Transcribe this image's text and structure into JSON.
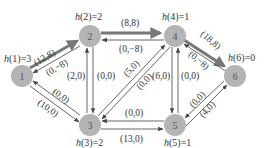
{
  "diagram": {
    "type": "flow-network-with-potentials",
    "nodes": [
      {
        "id": "1",
        "label": "1",
        "h_label": "h(1)=3",
        "x": 22,
        "y": 76
      },
      {
        "id": "2",
        "label": "2",
        "h_label": "h(2)=2",
        "x": 90,
        "y": 36
      },
      {
        "id": "3",
        "label": "3",
        "h_label": "h(3)=2",
        "x": 90,
        "y": 125
      },
      {
        "id": "4",
        "label": "4",
        "h_label": "h(4)=1",
        "x": 175,
        "y": 36
      },
      {
        "id": "5",
        "label": "5",
        "h_label": "h(5)=1",
        "x": 175,
        "y": 125
      },
      {
        "id": "6",
        "label": "6",
        "h_label": "h(6)=0",
        "x": 235,
        "y": 76
      }
    ],
    "edges": [
      {
        "from": "1",
        "to": "2",
        "label": "(12,8)",
        "style": "thick"
      },
      {
        "from": "2",
        "to": "1",
        "label": "(0,-8)",
        "style": "thin"
      },
      {
        "from": "1",
        "to": "3",
        "label": "(10,0)",
        "style": "thin"
      },
      {
        "from": "3",
        "to": "1",
        "label": "(0,0)",
        "style": "thin"
      },
      {
        "from": "2",
        "to": "4",
        "label": "(8,8)",
        "style": "thick"
      },
      {
        "from": "4",
        "to": "2",
        "label": "(0,-8)",
        "style": "thin"
      },
      {
        "from": "2",
        "to": "3",
        "label": "(2,0)",
        "style": "thin"
      },
      {
        "from": "3",
        "to": "2",
        "label": "(0,0)",
        "style": "thin"
      },
      {
        "from": "3",
        "to": "4",
        "label": "(5,0)",
        "style": "thin"
      },
      {
        "from": "4",
        "to": "3",
        "label": "(0,0)",
        "style": "thin"
      },
      {
        "from": "4",
        "to": "5",
        "label": "(6,0)",
        "style": "thin"
      },
      {
        "from": "5",
        "to": "4",
        "label": "(0,0)",
        "style": "thin"
      },
      {
        "from": "3",
        "to": "5",
        "label": "(13,0)",
        "style": "thin"
      },
      {
        "from": "5",
        "to": "3",
        "label": "(0,0)",
        "style": "thin"
      },
      {
        "from": "4",
        "to": "6",
        "label": "(18,8)",
        "style": "thick"
      },
      {
        "from": "6",
        "to": "4",
        "label": "(0,-8)",
        "style": "thin"
      },
      {
        "from": "5",
        "to": "6",
        "label": "(4,0)",
        "style": "thin"
      },
      {
        "from": "6",
        "to": "5",
        "label": "(0,0)",
        "style": "thin"
      }
    ]
  },
  "labels": {
    "n1": "1",
    "n2": "2",
    "n3": "3",
    "n4": "4",
    "n5": "5",
    "n6": "6",
    "h1_fn": "h",
    "h1_rest": "(1)=3",
    "h2_fn": "h",
    "h2_rest": "(2)=2",
    "h3_fn": "h",
    "h3_rest": "(3)=2",
    "h4_fn": "h",
    "h4_rest": "(4)=1",
    "h5_fn": "h",
    "h5_rest": "(5)=1",
    "h6_fn": "h",
    "h6_rest": "(6)=0",
    "e12": "(12,8)",
    "e21": "(0,−8)",
    "e13": "(10,0)",
    "e31": "(0,0)",
    "e24": "(8,8)",
    "e42": "(0,−8)",
    "e23": "(2,0)",
    "e32": "(0,0)",
    "e34": "(5,0)",
    "e43": "(0,0)",
    "e45": "(6,0)",
    "e54": "(0,0)",
    "e35": "(13,0)",
    "e53": "(0,0)",
    "e46": "(18,8)",
    "e64": "(0,−8)",
    "e56": "(4,0)",
    "e65": "(0,0)"
  },
  "colors": {
    "node_fill": "#b4b4b4",
    "thin_edge": "#555555",
    "thick_edge": "#777777",
    "text": "#333333"
  }
}
